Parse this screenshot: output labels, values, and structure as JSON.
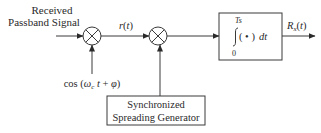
{
  "diagram": {
    "type": "block-diagram",
    "input": {
      "label_line1": "Received",
      "label_line2": "Passband Signal"
    },
    "mixer1": {
      "symbol": "multiplier",
      "lo_input_label": "cos (ω_c t + φ)",
      "lo_prefix": "cos (",
      "lo_omega": "ω",
      "lo_sub": "c",
      "lo_rest": "t + φ)"
    },
    "intermediate_signal": {
      "label": "r(t)",
      "label_r": "r",
      "label_arg": "(t)"
    },
    "mixer2": {
      "symbol": "multiplier"
    },
    "integrator": {
      "upper_limit": "Ts",
      "lower_limit": "0",
      "integrand": "( • ) dt",
      "integrand_paren": "( • )",
      "integrand_dt": "dt"
    },
    "output": {
      "label": "R_x(t)",
      "label_R": "R",
      "label_sub": "x",
      "label_arg": "(t)"
    },
    "generator": {
      "label_line1": "Synchronized",
      "label_line2": "Spreading Generator"
    }
  }
}
